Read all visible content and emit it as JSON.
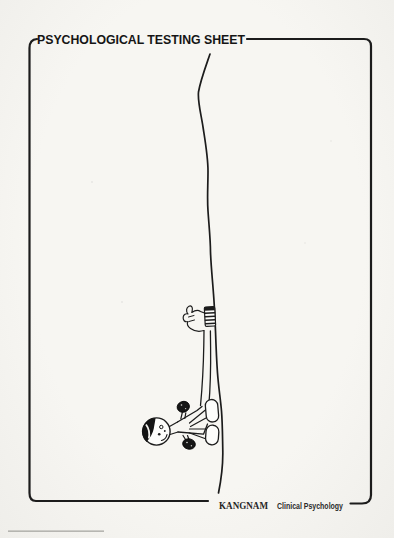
{
  "colors": {
    "ink": "#1c1c1c",
    "paper": "#f4f3ef",
    "fill_white": "#fdfdfb"
  },
  "header": {
    "title": "PSYCHOLOGICAL TESTING SHEET"
  },
  "footer": {
    "org": "KANGNAM",
    "dept": "Clinical Psychology"
  },
  "drawing": {
    "kind": "hand-drawn pencil sketch, rotated sideways",
    "elements": [
      "long-wavy-ground-line",
      "person-figure-with-cap",
      "raised-arm-gripping-line",
      "striped-wrist-cuff",
      "two-dark-fists",
      "two-shoes-touching-line"
    ]
  }
}
